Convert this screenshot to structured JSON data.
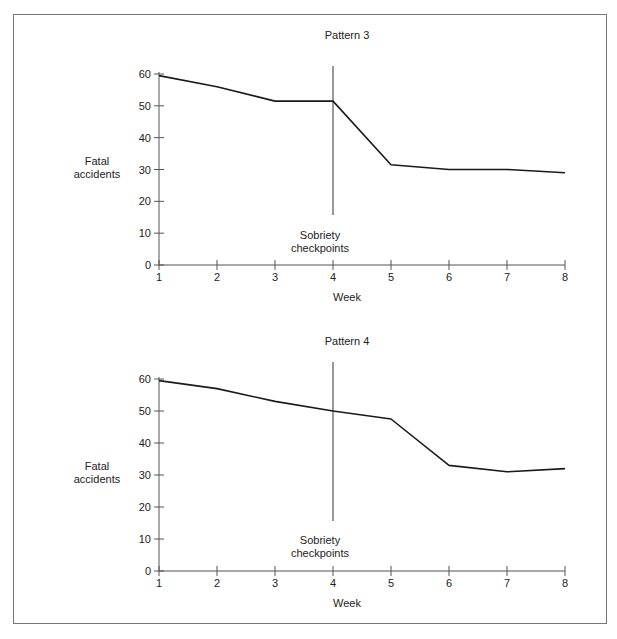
{
  "chart_data": [
    {
      "type": "line",
      "title": "Pattern 3",
      "xlabel": "Week",
      "ylabel": "Fatal accidents",
      "x": [
        1,
        2,
        3,
        4,
        5,
        6,
        7,
        8
      ],
      "values": [
        59.5,
        56,
        51.5,
        51.5,
        31.5,
        30,
        30,
        29
      ],
      "ylim": [
        0,
        60
      ],
      "yticks": [
        0,
        10,
        20,
        30,
        40,
        50,
        60
      ],
      "xticks": [
        1,
        2,
        3,
        4,
        5,
        6,
        7,
        8
      ],
      "grid": false,
      "annotations": [
        {
          "type": "vline",
          "x": 4,
          "label": "Sobriety checkpoints"
        }
      ]
    },
    {
      "type": "line",
      "title": "Pattern 4",
      "xlabel": "Week",
      "ylabel": "Fatal accidents",
      "x": [
        1,
        2,
        3,
        4,
        5,
        6,
        7,
        8
      ],
      "values": [
        59.5,
        57,
        53,
        50,
        47.5,
        33,
        31,
        32
      ],
      "ylim": [
        0,
        60
      ],
      "yticks": [
        0,
        10,
        20,
        30,
        40,
        50,
        60
      ],
      "xticks": [
        1,
        2,
        3,
        4,
        5,
        6,
        7,
        8
      ],
      "grid": false,
      "annotations": [
        {
          "type": "vline",
          "x": 4,
          "label": "Sobriety checkpoints"
        }
      ]
    }
  ],
  "charts": [
    {
      "title": "Pattern 3",
      "ylabel_line1": "Fatal",
      "ylabel_line2": "accidents",
      "xlabel": "Week",
      "annotation_line1": "Sobriety",
      "annotation_line2": "checkpoints"
    },
    {
      "title": "Pattern 4",
      "ylabel_line1": "Fatal",
      "ylabel_line2": "accidents",
      "xlabel": "Week",
      "annotation_line1": "Sobriety",
      "annotation_line2": "checkpoints"
    }
  ]
}
